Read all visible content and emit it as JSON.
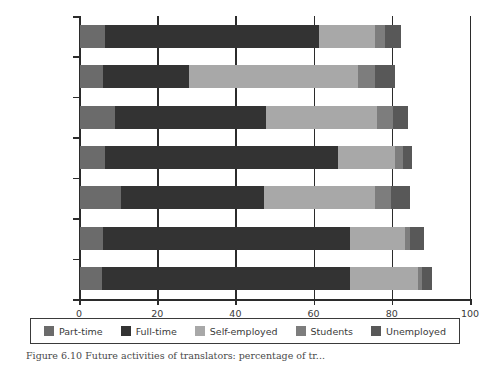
{
  "chart_data": {
    "type": "bar",
    "orientation": "horizontal",
    "stacked": true,
    "title": "",
    "xlabel": "",
    "ylabel": "",
    "xlim": [
      0,
      100
    ],
    "xticks": [
      0,
      20,
      40,
      60,
      80,
      100
    ],
    "xtick_labels": [
      "0",
      "20",
      "40",
      "60",
      "80",
      "100"
    ],
    "grid": false,
    "legend_position": "bottom",
    "categories": [
      "Canada",
      "Romania",
      "Poland",
      "South Africa",
      "Lithuania",
      "Australia",
      "New Zealand"
    ],
    "series": [
      {
        "name": "Part-time",
        "color": "#6b6b6b",
        "values": [
          6.5,
          6.0,
          9.0,
          6.5,
          10.5,
          6.0,
          5.5
        ]
      },
      {
        "name": "Full-time",
        "color": "#333333",
        "values": [
          54.5,
          22.0,
          38.5,
          59.5,
          36.5,
          63.0,
          63.5
        ]
      },
      {
        "name": "Self-employed",
        "color": "#a8a8a8",
        "values": [
          14.5,
          43.0,
          28.5,
          14.5,
          28.5,
          14.0,
          17.5
        ]
      },
      {
        "name": "Students",
        "color": "#7d7d7d",
        "values": [
          2.5,
          4.5,
          4.0,
          2.0,
          4.0,
          1.5,
          1.0
        ]
      },
      {
        "name": "Unemployed",
        "color": "#585858",
        "values": [
          4.0,
          5.0,
          4.0,
          2.5,
          5.0,
          3.5,
          2.5
        ]
      }
    ],
    "totals": [
      82.0,
      80.5,
      84.0,
      85.0,
      84.5,
      88.0,
      90.0
    ]
  },
  "legend": {
    "items": [
      {
        "label": "Part-time",
        "color": "#6b6b6b"
      },
      {
        "label": "Full-time",
        "color": "#333333"
      },
      {
        "label": "Self-employed",
        "color": "#a8a8a8"
      },
      {
        "label": "Students",
        "color": "#7d7d7d"
      },
      {
        "label": "Unemployed",
        "color": "#585858"
      }
    ]
  },
  "caption": {
    "text": "Figure 6.10 Future activities of translators: percentage of tr..."
  },
  "colors": {
    "axis": "#2b2b2b",
    "text": "#3a3a3a",
    "background": "#ffffff"
  }
}
